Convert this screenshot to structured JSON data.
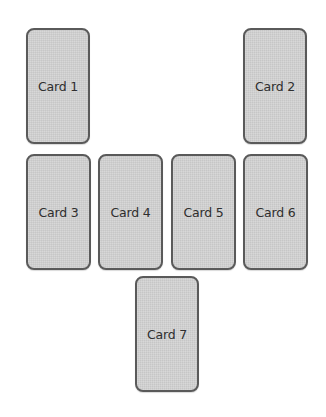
{
  "diagram": {
    "type": "card-spread-layout",
    "cards": [
      {
        "label": "Card 1",
        "x": 26,
        "y": 28,
        "w": 64,
        "h": 116
      },
      {
        "label": "Card 2",
        "x": 243,
        "y": 28,
        "w": 64,
        "h": 116
      },
      {
        "label": "Card 3",
        "x": 26,
        "y": 154,
        "w": 65,
        "h": 116
      },
      {
        "label": "Card 4",
        "x": 98,
        "y": 154,
        "w": 65,
        "h": 116
      },
      {
        "label": "Card 5",
        "x": 171,
        "y": 154,
        "w": 65,
        "h": 116
      },
      {
        "label": "Card 6",
        "x": 243,
        "y": 154,
        "w": 65,
        "h": 116
      },
      {
        "label": "Card 7",
        "x": 135,
        "y": 276,
        "w": 64,
        "h": 116
      }
    ],
    "colors": {
      "card_fill": "#d3d3d3",
      "card_border": "#5a5a5a",
      "label_text": "#2e2e2e",
      "background": "#ffffff"
    }
  }
}
